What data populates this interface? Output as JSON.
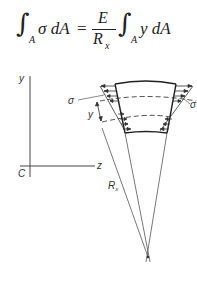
{
  "equation": {
    "lhs_integral_subscript": "A",
    "lhs_integrand": "σ dA",
    "equals": "=",
    "fraction_numerator": "E",
    "fraction_denominator_base": "R",
    "fraction_denominator_subscript": "x",
    "rhs_integral_subscript": "A",
    "rhs_integrand": "y dA"
  },
  "diagram": {
    "axis_y_label": "y",
    "axis_z_label": "z",
    "origin_label": "C",
    "stress_label_left": "σ",
    "stress_label_right": "σ",
    "distance_label": "y",
    "radius_label_base": "R",
    "radius_label_subscript": "x",
    "line_color": "#333333"
  }
}
